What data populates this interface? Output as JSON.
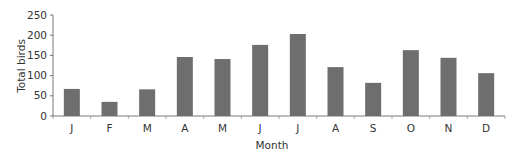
{
  "chart_data": {
    "type": "bar",
    "title": "",
    "xlabel": "Month",
    "ylabel": "Total birds",
    "categories": [
      "J",
      "F",
      "M",
      "A",
      "M",
      "J",
      "J",
      "A",
      "S",
      "O",
      "N",
      "D"
    ],
    "values": [
      67,
      35,
      66,
      146,
      141,
      176,
      203,
      121,
      82,
      163,
      144,
      106
    ],
    "ylim": [
      0,
      250
    ],
    "yticks": [
      0,
      50,
      100,
      150,
      200,
      250
    ],
    "grid": false,
    "legend": null,
    "bar_color": "#6e6e6e"
  }
}
